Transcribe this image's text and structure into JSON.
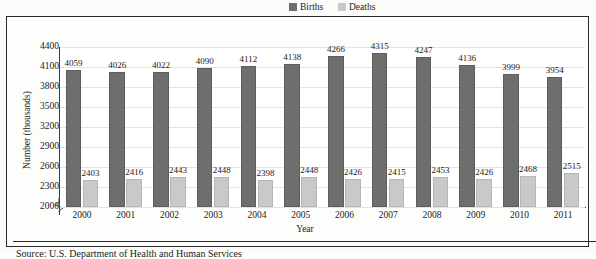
{
  "chart_data": {
    "type": "bar",
    "title": "",
    "xlabel": "Year",
    "ylabel": "Number (thousands)",
    "categories": [
      "2000",
      "2001",
      "2002",
      "2003",
      "2004",
      "2005",
      "2006",
      "2007",
      "2008",
      "2009",
      "2010",
      "2011"
    ],
    "series": [
      {
        "name": "Births",
        "color": "#6e6e6e",
        "values": [
          4059,
          4026,
          4022,
          4090,
          4112,
          4138,
          4266,
          4315,
          4247,
          4136,
          3999,
          3954
        ]
      },
      {
        "name": "Deaths",
        "color": "#c9c9c9",
        "values": [
          2403,
          2416,
          2443,
          2448,
          2398,
          2448,
          2426,
          2415,
          2453,
          2426,
          2468,
          2515
        ]
      }
    ],
    "ylim": [
      2000,
      4400
    ],
    "ytick_values": [
      2000,
      2300,
      2600,
      2900,
      3200,
      3500,
      3800,
      4100,
      4400
    ],
    "ytick_labels": [
      "2000",
      "2300",
      "2600",
      "2900",
      "3200",
      "3500",
      "3800",
      "4100",
      "4400"
    ],
    "grid": true,
    "axis_break": true,
    "legend_position": "top-right",
    "data_labels": true
  },
  "legend": {
    "births_label": "Births",
    "deaths_label": "Deaths"
  },
  "source": {
    "text": "Source: U.S. Department of Health and Human Services"
  }
}
